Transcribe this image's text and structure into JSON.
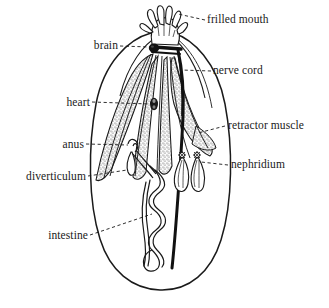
{
  "figure": {
    "background_color": "#ffffff",
    "ink_color": "#1a1a1a",
    "stipple_color": "#555555",
    "width": 329,
    "height": 308
  },
  "labels": {
    "frilled_mouth": "frilled mouth",
    "brain": "brain",
    "nerve_cord": "nerve cord",
    "heart": "heart",
    "retractor_muscle": "retractor muscle",
    "anus": "anus",
    "nephridium": "nephridium",
    "diverticulum": "diverticulum",
    "intestine": "intestine"
  },
  "parts": [
    {
      "id": "frilled-mouth",
      "label": "frilled mouth",
      "side": "right",
      "label_x": 207,
      "label_y": 20,
      "leader_from": [
        205,
        24
      ],
      "leader_to": [
        176,
        16
      ]
    },
    {
      "id": "brain",
      "label": "brain",
      "side": "left",
      "label_x": 86,
      "label_y": 41,
      "leader_from": [
        122,
        45
      ],
      "leader_to": [
        153,
        47
      ]
    },
    {
      "id": "nerve-cord",
      "label": "nerve cord",
      "side": "right",
      "label_x": 213,
      "label_y": 68,
      "leader_from": [
        211,
        72
      ],
      "leader_to": [
        182,
        71
      ]
    },
    {
      "id": "heart",
      "label": "heart",
      "side": "left",
      "label_x": 56,
      "label_y": 99,
      "leader_from": [
        92,
        103
      ],
      "leader_to": [
        152,
        104
      ]
    },
    {
      "id": "retractor-muscle",
      "label": "retractor muscle",
      "side": "right",
      "label_x": 227,
      "label_y": 124,
      "leader_from": [
        225,
        128
      ],
      "leader_to": [
        199,
        133
      ]
    },
    {
      "id": "anus",
      "label": "anus",
      "side": "left",
      "label_x": 53,
      "label_y": 141,
      "leader_from": [
        86,
        145
      ],
      "leader_to": [
        127,
        145
      ]
    },
    {
      "id": "nephridium",
      "label": "nephridium",
      "side": "right",
      "label_x": 230,
      "label_y": 163,
      "leader_from": [
        228,
        167
      ],
      "leader_to": [
        199,
        162
      ]
    },
    {
      "id": "diverticulum",
      "label": "diverticulum",
      "side": "left",
      "label_x": 12,
      "label_y": 173,
      "leader_from": [
        85,
        177
      ],
      "leader_to": [
        126,
        170
      ]
    },
    {
      "id": "intestine",
      "label": "intestine",
      "side": "left",
      "label_x": 40,
      "label_y": 233,
      "leader_from": [
        90,
        237
      ],
      "leader_to": [
        152,
        215
      ]
    }
  ]
}
